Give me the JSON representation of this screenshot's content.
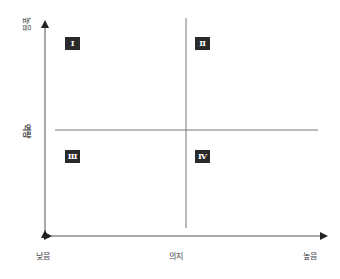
{
  "diagram": {
    "type": "2x2 quadrant matrix",
    "y_axis": {
      "label": "역량",
      "high_label": "높음"
    },
    "x_axis": {
      "label": "의지",
      "low_label": "낮음",
      "high_label": "높음"
    },
    "quadrants": [
      {
        "id": "q1",
        "label": "Ⅰ",
        "position": "top-left"
      },
      {
        "id": "q2",
        "label": "Ⅱ",
        "position": "top-right"
      },
      {
        "id": "q3",
        "label": "Ⅲ",
        "position": "bottom-left"
      },
      {
        "id": "q4",
        "label": "Ⅳ",
        "position": "bottom-right"
      }
    ],
    "colors": {
      "axis": "#333333",
      "divider": "#777777",
      "badge_bg": "#2a2a2a",
      "badge_text": "#ffffff"
    }
  }
}
